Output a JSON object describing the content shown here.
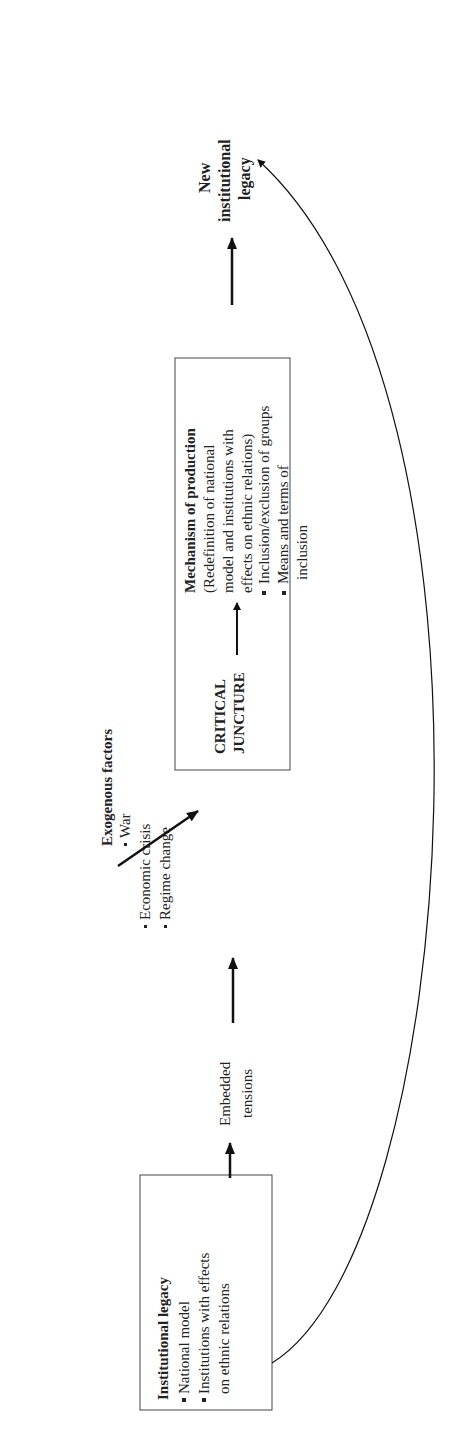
{
  "diagram": {
    "institutional_legacy": {
      "title": "Institutional legacy",
      "items": [
        "National model",
        "Institutions with effects",
        "on ethnic relations"
      ]
    },
    "exogenous_factors": {
      "title": "Exogenous factors",
      "items": [
        "War",
        "Economic crisis",
        "Regime change"
      ]
    },
    "embedded_tensions": {
      "line1": "Embedded",
      "line2": "tensions"
    },
    "critical_juncture": {
      "line1": "CRITICAL",
      "line2": "JUNCTURE"
    },
    "mechanism": {
      "title": "Mechanism of production",
      "desc": [
        "(Redefinition of national",
        "model and institutions with",
        "effects on ethnic relations)"
      ],
      "items": [
        "Inclusion/exclusion of groups",
        "Means and terms  of",
        "inclusion"
      ]
    },
    "new_legacy": {
      "line1": "New",
      "line2": "institutional",
      "line3": "legacy"
    }
  }
}
